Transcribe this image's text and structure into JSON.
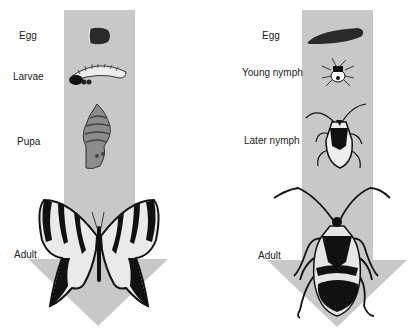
{
  "colors": {
    "arrow": "#c8c8c8",
    "ink": "#111111",
    "background": "#ffffff"
  },
  "left": {
    "title": "Complete metamorphosis",
    "stages": [
      {
        "label": "Egg"
      },
      {
        "label": "Larvae"
      },
      {
        "label": "Pupa"
      },
      {
        "label": "Adult"
      }
    ]
  },
  "right": {
    "title": "Incomplete metamorphosis",
    "stages": [
      {
        "label": "Egg"
      },
      {
        "label": "Young nymph"
      },
      {
        "label": "Later nymph"
      },
      {
        "label": "Adult"
      }
    ]
  }
}
